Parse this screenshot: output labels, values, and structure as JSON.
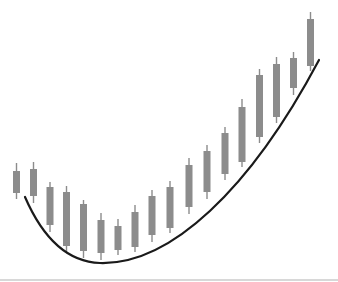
{
  "chart_data": {
    "type": "candlestick",
    "title": "",
    "xlabel": "",
    "ylabel": "",
    "grid": false,
    "legend": null,
    "candle_color": "#8c8c8c",
    "trendline_color": "#1a1a1a",
    "divider_color": "#d8d8d8",
    "price_scale_note": "relative units (no axis shown)",
    "ylim": [
      0,
      280
    ],
    "candles": [
      {
        "x": 16.5,
        "high": 117,
        "low": 81,
        "body_top": 109,
        "body_bottom": 87
      },
      {
        "x": 33.5,
        "high": 118,
        "low": 77,
        "body_top": 111,
        "body_bottom": 84
      },
      {
        "x": 50,
        "high": 98,
        "low": 48,
        "body_top": 93,
        "body_bottom": 55
      },
      {
        "x": 66.5,
        "high": 94,
        "low": 28,
        "body_top": 88,
        "body_bottom": 34
      },
      {
        "x": 83.5,
        "high": 80,
        "low": 22,
        "body_top": 76,
        "body_bottom": 29
      },
      {
        "x": 101,
        "high": 67,
        "low": 20,
        "body_top": 60,
        "body_bottom": 27
      },
      {
        "x": 118,
        "high": 61,
        "low": 25,
        "body_top": 54,
        "body_bottom": 30
      },
      {
        "x": 135,
        "high": 75,
        "low": 28,
        "body_top": 68,
        "body_bottom": 33
      },
      {
        "x": 152,
        "high": 90,
        "low": 38,
        "body_top": 84,
        "body_bottom": 45
      },
      {
        "x": 170,
        "high": 99,
        "low": 47,
        "body_top": 93,
        "body_bottom": 52
      },
      {
        "x": 189,
        "high": 122,
        "low": 66,
        "body_top": 115,
        "body_bottom": 73
      },
      {
        "x": 207,
        "high": 135,
        "low": 81,
        "body_top": 129,
        "body_bottom": 88
      },
      {
        "x": 225,
        "high": 153,
        "low": 100,
        "body_top": 147,
        "body_bottom": 106
      },
      {
        "x": 242,
        "high": 181,
        "low": 113,
        "body_top": 173,
        "body_bottom": 118
      },
      {
        "x": 259.5,
        "high": 211,
        "low": 137,
        "body_top": 205,
        "body_bottom": 143
      },
      {
        "x": 276.5,
        "high": 223,
        "low": 157,
        "body_top": 216,
        "body_bottom": 163
      },
      {
        "x": 293.5,
        "high": 228,
        "low": 185,
        "body_top": 222,
        "body_bottom": 192
      },
      {
        "x": 310.5,
        "high": 268,
        "low": 209,
        "body_top": 261,
        "body_bottom": 214
      }
    ],
    "trendline": {
      "type": "curved-support (parabolic / rounding bottom)",
      "points": [
        {
          "x": 25,
          "y": 83
        },
        {
          "x": 100,
          "y": 17
        },
        {
          "x": 319,
          "y": 220
        }
      ]
    },
    "annotations": []
  }
}
